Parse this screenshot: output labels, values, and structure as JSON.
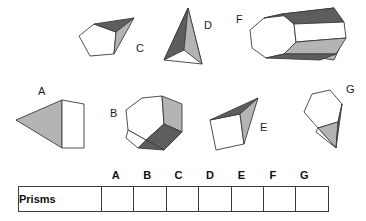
{
  "worksheet": {
    "title": "Prisms identification worksheet",
    "colors": {
      "outline": "#3c3c3c",
      "face_light": "#b4b4b4",
      "face_dark": "#5d5d5d",
      "face_white": "#ffffff",
      "text": "#111111",
      "background": "#ffffff"
    }
  },
  "solids": [
    {
      "id": "A",
      "label": "A",
      "name": "wedge-solid-a",
      "description": "Wedge with white quadrilateral front face and light grey triangular top face"
    },
    {
      "id": "B",
      "label": "B",
      "name": "pentagonal-prism-solid-b",
      "description": "Pentagonal prism with white front face, light grey side face and dark grey bottom face"
    },
    {
      "id": "C",
      "label": "C",
      "name": "pentagonal-pyramid-solid-c",
      "description": "Pentagonal pyramid with white base face, dark grey upper face and light grey lower face"
    },
    {
      "id": "D",
      "label": "D",
      "name": "tetrahedron-solid-d",
      "description": "Tall narrow tetrahedron with white front face and dark and light grey side faces"
    },
    {
      "id": "E",
      "label": "E",
      "name": "wedge-solid-e",
      "description": "Wedge with white square front face, dark grey top face and light grey side face"
    },
    {
      "id": "F",
      "label": "F",
      "name": "octagonal-prism-solid-f",
      "description": "Octagonal prism with white octagon end face, dark grey top face and light grey side face"
    },
    {
      "id": "G",
      "label": "G",
      "name": "hexagonal-pyramid-solid-g",
      "description": "Hexagonal pyramid with white hexagon base, light grey and dark grey triangular faces"
    }
  ],
  "table": {
    "column_headers": [
      "A",
      "B",
      "C",
      "D",
      "E",
      "F",
      "G"
    ],
    "rows": [
      {
        "label": "Prisms",
        "cells": [
          "",
          "",
          "",
          "",
          "",
          "",
          ""
        ]
      }
    ]
  }
}
